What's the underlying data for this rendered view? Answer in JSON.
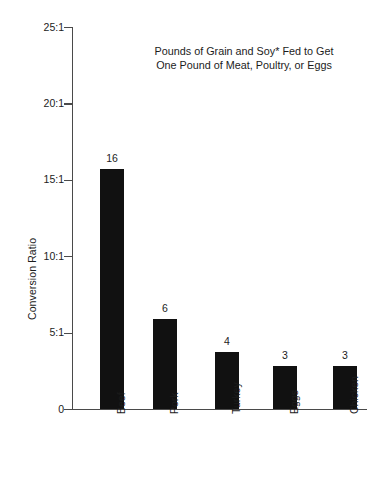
{
  "chart_data": {
    "type": "bar",
    "title": "Pounds of Grain and Soy* Fed to Get One Pound of Meat, Poultry, or Eggs",
    "title_line1": "Pounds of Grain and Soy* Fed to Get",
    "title_line2": "One Pound of Meat, Poultry, or Eggs",
    "categories": [
      "Beef",
      "Pork",
      "Turkey",
      "Eggs",
      "Chicken"
    ],
    "values": [
      16,
      6,
      4,
      3,
      3
    ],
    "value_labels": [
      "16",
      "6",
      "4",
      "3",
      "3"
    ],
    "plotted_values": [
      15.7,
      5.9,
      3.7,
      2.8,
      2.8
    ],
    "xlabel": "",
    "ylabel": "Conversion Ratio",
    "ylim": [
      0,
      25
    ],
    "ytick_values": [
      0,
      5,
      10,
      15,
      20,
      25
    ],
    "ytick_labels": [
      "0",
      "5:1",
      "10:1",
      "15:1",
      "20:1",
      "25:1"
    ],
    "grid": false,
    "legend": false,
    "bar_color": "#111111",
    "axis_color": "#4a4a4a",
    "text_color": "#1c1c1c",
    "background_color": "#ffffff"
  }
}
